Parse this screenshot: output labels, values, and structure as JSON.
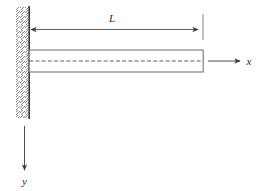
{
  "figure": {
    "kind": "engineering-diagram",
    "background_color": "#ffffff",
    "line_color": "#4a4a4a",
    "text_color": "#2b2b2b"
  },
  "labels": {
    "length": "L",
    "x_axis": "x",
    "y_axis": "y"
  },
  "elements": {
    "wall": {
      "name": "fixed-support-wall",
      "hatch_pattern": "diagonal-lines"
    },
    "beam": {
      "name": "beam-body"
    },
    "centerline": {
      "name": "neutral-axis-dashed-line"
    },
    "dimension": {
      "name": "length-dimension-L",
      "arrow_style": "double-headed"
    },
    "x_axis": {
      "name": "x-axis-arrow",
      "direction": "right"
    },
    "y_axis": {
      "name": "y-axis-arrow",
      "direction": "down"
    }
  }
}
